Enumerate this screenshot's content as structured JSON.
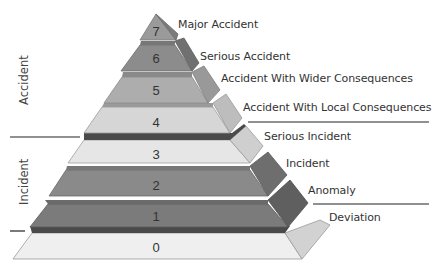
{
  "groups": [
    {
      "label": "Accident",
      "levels": [
        4,
        5,
        6,
        7
      ]
    },
    {
      "label": "Incident",
      "levels": [
        1,
        2,
        3
      ]
    }
  ],
  "levels": [
    {
      "number": "7",
      "label": "Major Accident",
      "color": "#9a9a9a",
      "side": "#7c7c7c"
    },
    {
      "number": "6",
      "label": "Serious Accident",
      "color": "#8c8c8c",
      "side": "#707070"
    },
    {
      "number": "5",
      "label": "Accident With Wider Consequences",
      "color": "#adadad",
      "side": "#999999"
    },
    {
      "number": "4",
      "label": "Accident With Local Consequences",
      "color": "#d6d6d6",
      "side": "#bdbdbd"
    },
    {
      "number": "3",
      "label": "Serious Incident",
      "color": "#e6e6e6",
      "side": "#cfcfcf"
    },
    {
      "number": "2",
      "label": "Incident",
      "color": "#8a8a8a",
      "side": "#6e6e6e"
    },
    {
      "number": "1",
      "label": "Anomaly",
      "color": "#7b7b7b",
      "side": "#5f5f5f"
    },
    {
      "number": "0",
      "label": "Deviation",
      "color": "#efefef",
      "side": "#d2d2d2"
    }
  ]
}
